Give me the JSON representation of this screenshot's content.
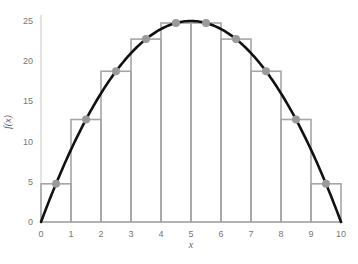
{
  "chart_data": {
    "type": "line",
    "title": "",
    "xlabel": "x",
    "ylabel": "f(x)",
    "xlim": [
      0,
      10
    ],
    "ylim": [
      0,
      25
    ],
    "x_ticks": [
      0,
      1,
      2,
      3,
      4,
      5,
      6,
      7,
      8,
      9,
      10
    ],
    "y_ticks": [
      0,
      5,
      10,
      15,
      20,
      25
    ],
    "grid": false,
    "legend": null,
    "function": "f(x) = x(10 - x)",
    "curve": {
      "x": [
        0,
        1,
        2,
        3,
        4,
        5,
        6,
        7,
        8,
        9,
        10
      ],
      "y": [
        0,
        9,
        16,
        21,
        24,
        25,
        24,
        21,
        16,
        9,
        0
      ]
    },
    "rectangles": {
      "description": "Midpoint Riemann sum rectangles, width 1",
      "left_edges": [
        0,
        1,
        2,
        3,
        4,
        5,
        6,
        7,
        8,
        9
      ],
      "widths": [
        1,
        1,
        1,
        1,
        1,
        1,
        1,
        1,
        1,
        1
      ],
      "heights": [
        4.75,
        12.75,
        18.75,
        22.75,
        24.75,
        24.75,
        22.75,
        18.75,
        12.75,
        4.75
      ]
    },
    "midpoints": {
      "x": [
        0.5,
        1.5,
        2.5,
        3.5,
        4.5,
        5.5,
        6.5,
        7.5,
        8.5,
        9.5
      ],
      "y": [
        4.75,
        12.75,
        18.75,
        22.75,
        24.75,
        24.75,
        22.75,
        18.75,
        12.75,
        4.75
      ]
    },
    "colors": {
      "curve": "#111111",
      "rectangles": "#a6a6a6",
      "points": "#9a9a9a",
      "axes": "#c8c8c8"
    }
  }
}
